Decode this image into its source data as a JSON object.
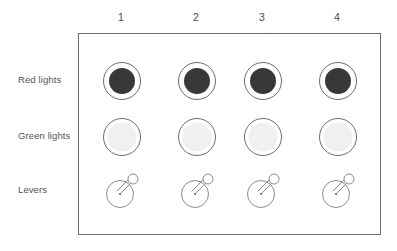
{
  "figure": {
    "background_color": "#ffffff",
    "border_color": "#6e6e6e"
  },
  "columns": [
    {
      "label": "1"
    },
    {
      "label": "2"
    },
    {
      "label": "3"
    },
    {
      "label": "4"
    }
  ],
  "rows": [
    {
      "key": "red_lights",
      "label": "Red lights",
      "type": "lamp",
      "state": "on",
      "fill_color": "#383838",
      "ring_color": "#6e6e6e",
      "gap_color": "#ffffff"
    },
    {
      "key": "green_lights",
      "label": "Green lights",
      "type": "lamp",
      "state": "off",
      "fill_color": "#f0f1ef",
      "ring_color": "#6e6e6e",
      "gap_color": "#ffffff"
    },
    {
      "key": "levers",
      "label": "Levers",
      "type": "lever",
      "state": "up-right",
      "fill_color": "#ffffff",
      "ring_color": "#8a8a8a",
      "gap_color": "#ffffff"
    }
  ],
  "cells": [
    {
      "row": "red_lights",
      "column": "1",
      "state": "on"
    },
    {
      "row": "red_lights",
      "column": "2",
      "state": "on"
    },
    {
      "row": "red_lights",
      "column": "3",
      "state": "on"
    },
    {
      "row": "red_lights",
      "column": "4",
      "state": "on"
    },
    {
      "row": "green_lights",
      "column": "1",
      "state": "off"
    },
    {
      "row": "green_lights",
      "column": "2",
      "state": "off"
    },
    {
      "row": "green_lights",
      "column": "3",
      "state": "off"
    },
    {
      "row": "green_lights",
      "column": "4",
      "state": "off"
    },
    {
      "row": "levers",
      "column": "1",
      "state": "up-right"
    },
    {
      "row": "levers",
      "column": "2",
      "state": "up-right"
    },
    {
      "row": "levers",
      "column": "3",
      "state": "up-right"
    },
    {
      "row": "levers",
      "column": "4",
      "state": "up-right"
    }
  ],
  "layout": {
    "column_centers_x": [
      121,
      196,
      262,
      337
    ],
    "row_centers_y": [
      80,
      136,
      190
    ],
    "panel": {
      "left": 78,
      "top": 33,
      "width": 303,
      "height": 202
    }
  }
}
